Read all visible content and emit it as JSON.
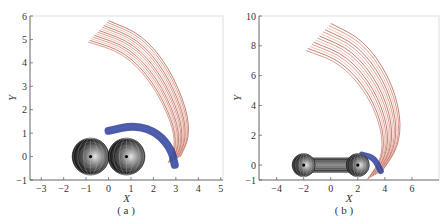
{
  "chart_data": [
    {
      "panel": "a",
      "type": "line",
      "caption": "( a )",
      "xlabel": "X",
      "ylabel": "Y",
      "xlim": [
        -3.5,
        5.1
      ],
      "ylim": [
        -1,
        6
      ],
      "xticks": [
        -3,
        -2,
        -1,
        0,
        1,
        2,
        3,
        4,
        5
      ],
      "yticks": [
        -1,
        0,
        1,
        2,
        3,
        4,
        5,
        6
      ],
      "grid": false,
      "spheres": [
        {
          "x": -0.8,
          "y": 0,
          "r": 0.82
        },
        {
          "x": 0.8,
          "y": 0,
          "r": 0.82
        }
      ],
      "connector": null,
      "series": [
        {
          "name": "blue trajectories",
          "color": "#2d3f9a",
          "path": [
            [
              0,
              1.1
            ],
            [
              1.2,
              1.35
            ],
            [
              2.2,
              1.0
            ],
            [
              2.8,
              0.3
            ],
            [
              2.95,
              -0.35
            ]
          ]
        },
        {
          "name": "red trajectories",
          "color": "#b5452e",
          "path": [
            [
              0,
              5.8
            ],
            [
              1.5,
              5.2
            ],
            [
              2.7,
              3.8
            ],
            [
              3.5,
              2.0
            ],
            [
              3.6,
              0.8
            ],
            [
              3.2,
              0.0
            ]
          ]
        }
      ],
      "red_band_count": 14,
      "red_band_spacing": 0.07
    },
    {
      "panel": "b",
      "type": "line",
      "caption": "( b )",
      "xlabel": "X",
      "ylabel": "Y",
      "xlim": [
        -5.3,
        8
      ],
      "ylim": [
        -1,
        10
      ],
      "xticks": [
        -4,
        -2,
        0,
        2,
        4,
        6
      ],
      "yticks": [
        -1,
        0,
        2,
        4,
        6,
        8,
        10
      ],
      "grid": false,
      "spheres": [
        {
          "x": -2,
          "y": 0,
          "r": 0.85
        },
        {
          "x": 2,
          "y": 0,
          "r": 0.85
        }
      ],
      "connector": {
        "x1": -2,
        "x2": 2,
        "half_height": 0.5
      },
      "series": [
        {
          "name": "blue trajectories",
          "color": "#2d3f9a",
          "path": [
            [
              2.3,
              0.7
            ],
            [
              3.2,
              0.5
            ],
            [
              3.7,
              -0.4
            ]
          ]
        },
        {
          "name": "red trajectories",
          "color": "#b5452e",
          "path": [
            [
              0,
              9.5
            ],
            [
              2.4,
              8.4
            ],
            [
              4.3,
              6.0
            ],
            [
              5.2,
              3.3
            ],
            [
              5.0,
              1.2
            ],
            [
              3.8,
              -0.4
            ]
          ]
        }
      ],
      "red_band_count": 14,
      "red_band_spacing": 0.14
    }
  ]
}
